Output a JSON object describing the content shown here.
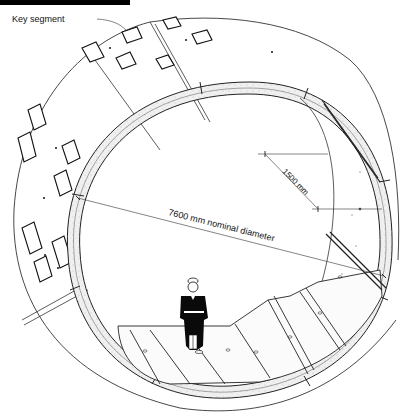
{
  "figure": {
    "type": "technical-illustration"
  },
  "labels": {
    "key_segment": "Key segment",
    "diameter": "7600 mm nominal diameter",
    "width": "1500 mm"
  },
  "colors": {
    "line": "#222222",
    "ring_face": "#ececec",
    "background": "#ffffff",
    "figure": "#000000"
  }
}
